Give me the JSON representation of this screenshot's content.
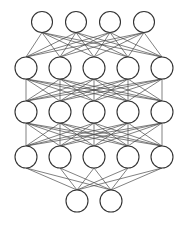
{
  "diagram": {
    "type": "feedforward-neural-network",
    "background": "#ffffff",
    "edge_color": "#4a4a4a",
    "node_stroke": "#333333",
    "node_fill": "#ffffff",
    "layers": [
      {
        "name": "input-layer",
        "y": 22,
        "r": 10.5,
        "x": [
          42,
          76,
          110,
          144
        ]
      },
      {
        "name": "hidden-layer-1",
        "y": 68,
        "r": 11,
        "x": [
          26,
          60,
          94,
          128,
          162
        ]
      },
      {
        "name": "hidden-layer-2",
        "y": 112,
        "r": 11,
        "x": [
          26,
          60,
          94,
          128,
          162
        ]
      },
      {
        "name": "hidden-layer-3",
        "y": 157,
        "r": 11,
        "x": [
          26,
          60,
          94,
          128,
          162
        ]
      },
      {
        "name": "output-layer",
        "y": 201,
        "r": 11,
        "x": [
          77,
          111
        ]
      }
    ],
    "connectivity": "fully-connected"
  }
}
